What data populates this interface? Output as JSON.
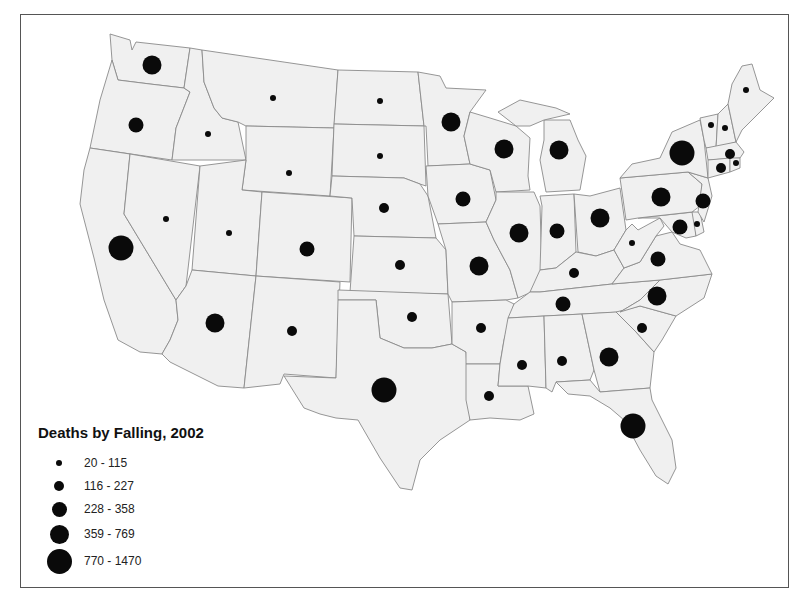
{
  "map": {
    "title": "Deaths by Falling, 2002",
    "fill_color": "#f0f0f0",
    "border_color": "#8a8a8a",
    "symbol_color": "#0a0a0a"
  },
  "legend": {
    "title": "Deaths by Falling, 2002",
    "classes": [
      {
        "label": "20 - 115",
        "diameter": 6
      },
      {
        "label": "116 - 227",
        "diameter": 10
      },
      {
        "label": "228 - 358",
        "diameter": 15
      },
      {
        "label": "359 - 769",
        "diameter": 19
      },
      {
        "label": "770 - 1470",
        "diameter": 25
      }
    ]
  },
  "chart_data": {
    "type": "proportional-symbol-map",
    "title": "Deaths by Falling, 2002",
    "region": "Contiguous United States",
    "legend_classes": [
      "20 - 115",
      "116 - 227",
      "228 - 358",
      "359 - 769",
      "770 - 1470"
    ],
    "states": [
      {
        "state": "WA",
        "class": "359 - 769",
        "x": 152,
        "y": 65
      },
      {
        "state": "OR",
        "class": "228 - 358",
        "x": 136,
        "y": 125
      },
      {
        "state": "ID",
        "class": "20 - 115",
        "x": 208,
        "y": 134
      },
      {
        "state": "MT",
        "class": "20 - 115",
        "x": 273,
        "y": 98
      },
      {
        "state": "WY",
        "class": "20 - 115",
        "x": 289,
        "y": 173
      },
      {
        "state": "CA",
        "class": "770 - 1470",
        "x": 121,
        "y": 248
      },
      {
        "state": "NV",
        "class": "20 - 115",
        "x": 166,
        "y": 219
      },
      {
        "state": "UT",
        "class": "20 - 115",
        "x": 229,
        "y": 233
      },
      {
        "state": "CO",
        "class": "228 - 358",
        "x": 307,
        "y": 249
      },
      {
        "state": "AZ",
        "class": "359 - 769",
        "x": 215,
        "y": 323
      },
      {
        "state": "NM",
        "class": "116 - 227",
        "x": 292,
        "y": 331
      },
      {
        "state": "ND",
        "class": "20 - 115",
        "x": 380,
        "y": 101
      },
      {
        "state": "SD",
        "class": "20 - 115",
        "x": 380,
        "y": 156
      },
      {
        "state": "NE",
        "class": "116 - 227",
        "x": 384,
        "y": 208
      },
      {
        "state": "KS",
        "class": "116 - 227",
        "x": 400,
        "y": 265
      },
      {
        "state": "OK",
        "class": "116 - 227",
        "x": 412,
        "y": 317
      },
      {
        "state": "TX",
        "class": "770 - 1470",
        "x": 384,
        "y": 390
      },
      {
        "state": "MN",
        "class": "359 - 769",
        "x": 451,
        "y": 122
      },
      {
        "state": "IA",
        "class": "228 - 358",
        "x": 463,
        "y": 199
      },
      {
        "state": "MO",
        "class": "359 - 769",
        "x": 479,
        "y": 266
      },
      {
        "state": "AR",
        "class": "116 - 227",
        "x": 481,
        "y": 328
      },
      {
        "state": "LA",
        "class": "116 - 227",
        "x": 489,
        "y": 396
      },
      {
        "state": "WI",
        "class": "359 - 769",
        "x": 504,
        "y": 149
      },
      {
        "state": "IL",
        "class": "359 - 769",
        "x": 519,
        "y": 233
      },
      {
        "state": "MI",
        "class": "359 - 769",
        "x": 559,
        "y": 150
      },
      {
        "state": "IN",
        "class": "228 - 358",
        "x": 557,
        "y": 231
      },
      {
        "state": "OH",
        "class": "359 - 769",
        "x": 600,
        "y": 218
      },
      {
        "state": "KY",
        "class": "116 - 227",
        "x": 574,
        "y": 273
      },
      {
        "state": "TN",
        "class": "228 - 358",
        "x": 563,
        "y": 304
      },
      {
        "state": "MS",
        "class": "116 - 227",
        "x": 522,
        "y": 365
      },
      {
        "state": "AL",
        "class": "116 - 227",
        "x": 562,
        "y": 361
      },
      {
        "state": "GA",
        "class": "359 - 769",
        "x": 609,
        "y": 357
      },
      {
        "state": "FL",
        "class": "770 - 1470",
        "x": 633,
        "y": 426
      },
      {
        "state": "WV",
        "class": "20 - 115",
        "x": 632,
        "y": 243
      },
      {
        "state": "VA",
        "class": "228 - 358",
        "x": 658,
        "y": 259
      },
      {
        "state": "NC",
        "class": "359 - 769",
        "x": 657,
        "y": 296
      },
      {
        "state": "SC",
        "class": "116 - 227",
        "x": 642,
        "y": 328
      },
      {
        "state": "PA",
        "class": "359 - 769",
        "x": 661,
        "y": 197
      },
      {
        "state": "NY",
        "class": "770 - 1470",
        "x": 682,
        "y": 153
      },
      {
        "state": "NJ",
        "class": "228 - 358",
        "x": 703,
        "y": 201
      },
      {
        "state": "MD",
        "class": "228 - 358",
        "x": 680,
        "y": 227
      },
      {
        "state": "DE",
        "class": "20 - 115",
        "x": 697,
        "y": 224
      },
      {
        "state": "ME",
        "class": "20 - 115",
        "x": 746,
        "y": 90
      },
      {
        "state": "VT",
        "class": "20 - 115",
        "x": 711,
        "y": 125
      },
      {
        "state": "NH",
        "class": "20 - 115",
        "x": 725,
        "y": 128
      },
      {
        "state": "MA",
        "class": "116 - 227",
        "x": 730,
        "y": 154
      },
      {
        "state": "CT",
        "class": "116 - 227",
        "x": 721,
        "y": 168
      },
      {
        "state": "RI",
        "class": "20 - 115",
        "x": 736,
        "y": 163
      }
    ]
  }
}
